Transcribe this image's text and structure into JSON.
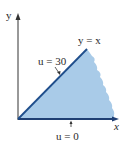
{
  "diagram": {
    "axes": {
      "x_label": "x",
      "y_label": "y"
    },
    "labels": {
      "line_diag": "y = x",
      "u_top": "u = 30",
      "u_bottom": "u = 0"
    },
    "colors": {
      "region_fill": "#a9cbe8",
      "boundary_line": "#1f4e8c",
      "axis": "#333333"
    }
  }
}
